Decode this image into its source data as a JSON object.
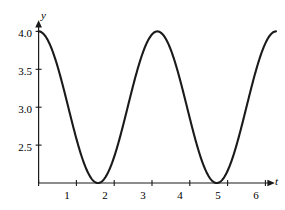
{
  "chart_data": {
    "type": "line",
    "title": "",
    "subtitle": "",
    "xlabel": "t",
    "ylabel": "y",
    "xlim": [
      -0.17,
      6.62
    ],
    "ylim": [
      1.95,
      4.12
    ],
    "grid": false,
    "legend": false,
    "legend_position": "none",
    "curve_color": "#1a1a1a",
    "axis_color": "#1a1a1a",
    "xticks": [
      1,
      2,
      3,
      4,
      5,
      6
    ],
    "xtick_labels": [
      "1",
      "2",
      "3",
      "4",
      "5",
      "6"
    ],
    "yticks": [
      2.5,
      3.0,
      3.5,
      4.0
    ],
    "ytick_labels": [
      "2.5",
      "3.0",
      "3.5",
      "4.0"
    ],
    "axis_baseline_y": 2,
    "annotations": [],
    "series": [
      {
        "name": "y = 3 + cos(2t)",
        "expression": "3 + cos(2*t)",
        "amplitude": 1,
        "midline": 3,
        "period": 3.14159,
        "maxima_t": [
          0,
          3.14159,
          6.28319
        ],
        "maxima_y": 4.0,
        "minima_t": [
          1.5708,
          4.71239
        ],
        "minima_y": 2.0,
        "x": [
          0.0,
          0.1,
          0.2,
          0.3,
          0.4,
          0.5,
          0.6,
          0.7,
          0.8,
          0.9,
          1.0,
          1.1,
          1.2,
          1.3,
          1.4,
          1.5,
          1.6,
          1.7,
          1.8,
          1.9,
          2.0,
          2.1,
          2.2,
          2.3,
          2.4,
          2.5,
          2.6,
          2.7,
          2.8,
          2.9,
          3.0,
          3.1,
          3.2,
          3.3,
          3.4,
          3.5,
          3.6,
          3.7,
          3.8,
          3.9,
          4.0,
          4.1,
          4.2,
          4.3,
          4.4,
          4.5,
          4.6,
          4.7,
          4.8,
          4.9,
          5.0,
          5.1,
          5.2,
          5.3,
          5.4,
          5.5,
          5.6,
          5.7,
          5.8,
          5.9,
          6.0,
          6.1,
          6.2,
          6.3,
          6.4
        ],
        "values": [
          4.0,
          3.98,
          3.92,
          3.83,
          3.7,
          3.54,
          3.36,
          3.17,
          2.97,
          2.77,
          2.58,
          2.41,
          2.26,
          2.13,
          2.04,
          2.0,
          2.0,
          2.03,
          2.1,
          2.21,
          2.35,
          2.5,
          2.68,
          2.87,
          3.07,
          3.28,
          3.47,
          3.63,
          3.78,
          3.9,
          3.96,
          4.0,
          3.99,
          3.94,
          3.86,
          3.75,
          3.6,
          3.42,
          3.23,
          3.03,
          2.82,
          2.63,
          2.45,
          2.3,
          2.17,
          2.08,
          2.02,
          2.0,
          2.01,
          2.07,
          2.16,
          2.28,
          2.43,
          2.6,
          2.79,
          2.98,
          3.18,
          3.37,
          3.55,
          3.7,
          3.84,
          3.93,
          3.98,
          4.0,
          3.99
        ]
      }
    ]
  },
  "axes": {
    "y_axis_name": "y",
    "x_axis_name": "t"
  }
}
